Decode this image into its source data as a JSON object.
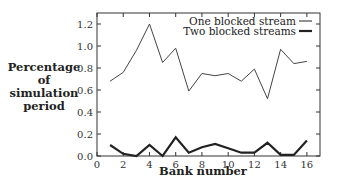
{
  "chart_data": {
    "type": "line",
    "title": "",
    "xlabel": "Bank number",
    "ylabel": [
      "Percentage",
      "of",
      "simulation",
      "period"
    ],
    "xlim": [
      0,
      17
    ],
    "ylim": [
      0,
      1.3
    ],
    "x_ticks": [
      0,
      2,
      4,
      6,
      8,
      10,
      12,
      14,
      16
    ],
    "x_tick_labels": [
      "0",
      "2",
      "4",
      "6",
      "8",
      "10",
      "12",
      "14",
      "16"
    ],
    "y_ticks": [
      0.0,
      0.2,
      0.4,
      0.6,
      0.8,
      1.0,
      1.2
    ],
    "y_tick_labels": [
      "0.0",
      "0.2",
      "0.4",
      "0.6",
      "0.8",
      "1.0",
      "1.2"
    ],
    "grid": false,
    "legend_position": "upper right",
    "x": [
      1,
      2,
      3,
      4,
      5,
      6,
      7,
      8,
      9,
      10,
      11,
      12,
      13,
      14,
      15,
      16
    ],
    "series": [
      {
        "name": "One blocked stream",
        "style": "thin",
        "values": [
          0.68,
          0.76,
          0.96,
          1.2,
          0.85,
          0.98,
          0.59,
          0.75,
          0.73,
          0.75,
          0.68,
          0.79,
          0.52,
          0.97,
          0.84,
          0.86
        ]
      },
      {
        "name": "Two blocked streams",
        "style": "thick",
        "values": [
          0.1,
          0.02,
          0.0,
          0.1,
          0.0,
          0.17,
          0.03,
          0.08,
          0.11,
          0.07,
          0.03,
          0.03,
          0.12,
          0.01,
          0.01,
          0.14
        ]
      }
    ]
  }
}
